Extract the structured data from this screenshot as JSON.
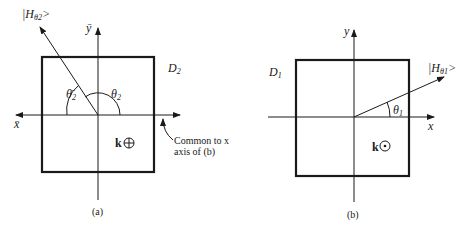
{
  "figure": {
    "panel_a": {
      "caption": "(a)",
      "domain_label": "D",
      "domain_sub": "2",
      "state_label_prefix": "|H",
      "state_label_sub": "θ2",
      "state_label_suffix": ">",
      "y_axis_label": "ȳ",
      "x_axis_label": "x̄",
      "angle_left_label": "θ̄",
      "angle_left_sub": "2",
      "angle_right_label": "θ",
      "angle_right_sub": "2",
      "k_label": "k",
      "k_symbol": "⊕",
      "annotation_line1": "Common to x",
      "annotation_line2": "axis of (b)"
    },
    "panel_b": {
      "caption": "(b)",
      "domain_label": "D",
      "domain_sub": "1",
      "state_label_prefix": "|H",
      "state_label_sub": "θ1",
      "state_label_suffix": ">",
      "y_axis_label": "y",
      "x_axis_label": "x",
      "angle_label": "θ",
      "angle_sub": "1",
      "k_label": "k",
      "k_symbol": "⊙"
    }
  }
}
